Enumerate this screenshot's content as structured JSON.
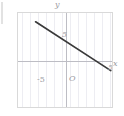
{
  "figure": {
    "background_color": "#ffffff",
    "plot_border_color": "#d9d9d9",
    "grid_color": "#ededf2",
    "axis_color": "#bdbdc4",
    "label_color": "#9a9aa2",
    "line_color": "#3a3a3a"
  },
  "labels": {
    "y_axis_name": "y",
    "x_axis_name": "x",
    "origin": "O",
    "y_tick_positive": "5",
    "y_tick_negative": "-5",
    "x_tick_negative": "-5",
    "x_tick_positive": "5"
  },
  "chart_data": {
    "type": "line",
    "title": "",
    "xlabel": "x",
    "ylabel": "y",
    "xlim": [
      -6,
      6
    ],
    "ylim": [
      -6,
      6
    ],
    "xticks": [
      -5,
      5
    ],
    "yticks": [
      -5,
      5
    ],
    "xtick_labels": [
      "-5",
      "5"
    ],
    "ytick_labels": [
      "-5",
      "5"
    ],
    "grid": "vertical-only",
    "legend": "none",
    "origin_label": "O",
    "series": [
      {
        "name": "line",
        "equation": "y = -0.65x + 2.4",
        "slope": -0.65,
        "intercept": 2.4,
        "x": [
          -3.8,
          5.6
        ],
        "y": [
          4.9,
          -1.2
        ],
        "endpoints": [
          [
            -3.8,
            4.9
          ],
          [
            5.6,
            -1.2
          ]
        ]
      }
    ]
  }
}
